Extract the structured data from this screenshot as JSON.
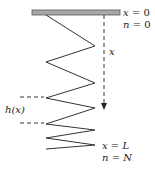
{
  "diagram": {
    "type": "hanging-spring",
    "colors": {
      "ceiling_fill": "#a8a8a8",
      "ceiling_stroke": "#555555",
      "spring_stroke": "#333333",
      "dash_stroke": "#333333",
      "text": "#222222"
    },
    "ceiling": {
      "x": 32,
      "y": 10,
      "width": 88,
      "height": 5
    },
    "spring_points": "46,15 95,46 46,62 95,83 46,98 95,108 46,124 95,130 46,138 95,145 46,149",
    "axis": {
      "x": 104,
      "y_start": 15,
      "y_end": 104,
      "label": "x",
      "label_x": 109,
      "label_y": 55
    },
    "height_marker": {
      "label": "h(x)",
      "label_x": 5,
      "label_y": 113,
      "y_top": 97,
      "y_bottom": 123,
      "x_start": 20,
      "x_end": 44
    },
    "top_labels": [
      {
        "var": "x",
        "eq": " = 0",
        "x": 123,
        "y": 16
      },
      {
        "var": "n",
        "eq": " = 0",
        "x": 123,
        "y": 28
      }
    ],
    "bottom_labels": [
      {
        "var": "x",
        "eq": " = ",
        "val": "L",
        "x": 102,
        "y": 149
      },
      {
        "var": "n",
        "eq": " = ",
        "val": "N",
        "x": 102,
        "y": 161
      }
    ]
  }
}
